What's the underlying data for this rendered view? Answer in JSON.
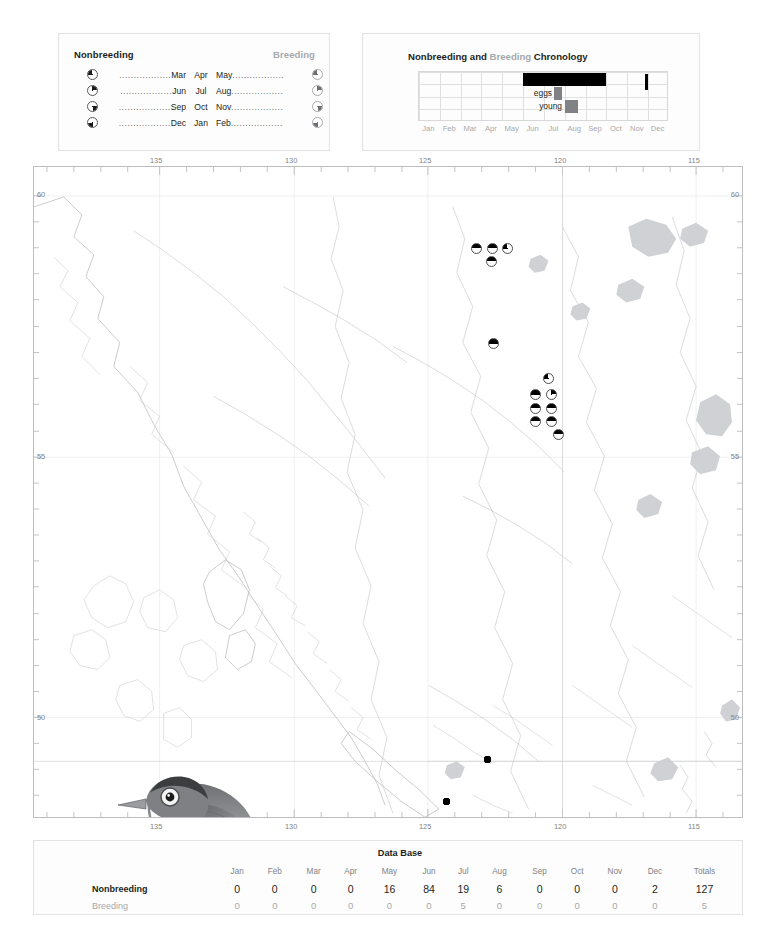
{
  "species": {
    "common_name": "Canada Warbler"
  },
  "season_legend": {
    "heading_left": "Nonbreeding",
    "heading_right": "Breeding",
    "dots": "..................",
    "rows": [
      {
        "icon_left": "quarter-pie-top-left-icon",
        "m1": "Mar",
        "m2": "Apr",
        "m3": "May",
        "icon_right": "quarter-pie-top-left-icon"
      },
      {
        "icon_left": "quarter-pie-top-right-icon",
        "m1": "Jun",
        "m2": "Jul",
        "m3": "Aug",
        "icon_right": "quarter-pie-top-right-icon"
      },
      {
        "icon_left": "quarter-pie-bottom-right-icon",
        "m1": "Sep",
        "m2": "Oct",
        "m3": "Nov",
        "icon_right": "quarter-pie-bottom-right-icon"
      },
      {
        "icon_left": "quarter-pie-bottom-left-icon",
        "m1": "Dec",
        "m2": "Jan",
        "m3": "Feb",
        "icon_right": "quarter-pie-bottom-left-icon"
      }
    ]
  },
  "chronology": {
    "title_part1": "Nonbreeding and ",
    "title_breeding": "Breeding",
    "title_part2": " Chronology",
    "months": [
      "Jan",
      "Feb",
      "Mar",
      "Apr",
      "May",
      "Jun",
      "Jul",
      "Aug",
      "Sep",
      "Oct",
      "Nov",
      "Dec"
    ],
    "label_eggs": "eggs",
    "label_young": "young",
    "bars": [
      {
        "name": "occurrence",
        "start_month": "May",
        "end_month": "Aug",
        "color": "#000000",
        "row": 1
      },
      {
        "name": "eggs",
        "start_month": "Jun",
        "end_month": "Jun",
        "color": "#808285",
        "row": 2
      },
      {
        "name": "young",
        "start_month": "Jul",
        "end_month": "Jul",
        "color": "#808285",
        "row": 3
      },
      {
        "name": "late-record",
        "start_month": "Nov",
        "end_month": "Nov",
        "color": "#000000",
        "row": 1
      }
    ]
  },
  "map": {
    "longitude_labels": [
      "135",
      "130",
      "125",
      "120",
      "115"
    ],
    "latitude_labels": [
      "60",
      "55",
      "50"
    ],
    "markers": [
      {
        "x": 470,
        "y": 248,
        "style": "half"
      },
      {
        "x": 486,
        "y": 248,
        "style": "half"
      },
      {
        "x": 501,
        "y": 248,
        "style": "tl"
      },
      {
        "x": 485,
        "y": 261,
        "style": "half"
      },
      {
        "x": 487,
        "y": 343,
        "style": "half"
      },
      {
        "x": 542,
        "y": 378,
        "style": "tl"
      },
      {
        "x": 529,
        "y": 394,
        "style": "half"
      },
      {
        "x": 545,
        "y": 394,
        "style": "tr"
      },
      {
        "x": 529,
        "y": 408,
        "style": "half"
      },
      {
        "x": 545,
        "y": 408,
        "style": "half"
      },
      {
        "x": 529,
        "y": 421,
        "style": "half"
      },
      {
        "x": 545,
        "y": 421,
        "style": "half"
      },
      {
        "x": 552,
        "y": 434,
        "style": "half"
      },
      {
        "x": 483,
        "y": 760,
        "style": "sq"
      },
      {
        "x": 442,
        "y": 802,
        "style": "sq"
      }
    ]
  },
  "database": {
    "title": "Data Base",
    "month_headers": [
      "Jan",
      "Feb",
      "Mar",
      "Apr",
      "May",
      "Jun",
      "Jul",
      "Aug",
      "Sep",
      "Oct",
      "Nov",
      "Dec"
    ],
    "totals_header": "Totals",
    "rows": [
      {
        "label": "Nonbreeding",
        "values": [
          0,
          0,
          0,
          0,
          16,
          84,
          19,
          6,
          0,
          0,
          0,
          2
        ],
        "total": 127
      },
      {
        "label": "Breeding",
        "values": [
          0,
          0,
          0,
          0,
          0,
          0,
          5,
          0,
          0,
          0,
          0,
          0
        ],
        "total": 5
      }
    ]
  },
  "colors": {
    "ink": "#231f20",
    "gray_text": "#a7a9ac",
    "bar_black": "#000000",
    "bar_gray": "#808285"
  }
}
